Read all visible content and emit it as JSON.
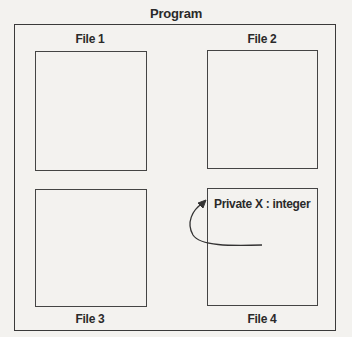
{
  "diagram": {
    "title": "Program",
    "files": [
      {
        "label": "File 1"
      },
      {
        "label": "File 2"
      },
      {
        "label": "File 3"
      },
      {
        "label": "File 4",
        "content": "Private X : integer"
      }
    ],
    "colors": {
      "line": "#3a3a3a",
      "background": "#f3f2ef"
    }
  }
}
